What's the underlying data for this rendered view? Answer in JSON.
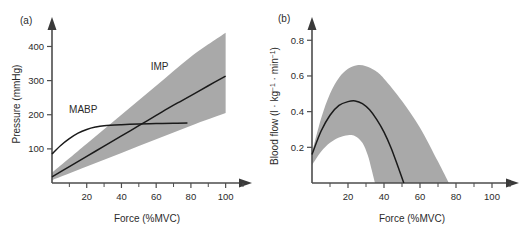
{
  "figure": {
    "background": "#ffffff",
    "band_color": "#a9a9a9",
    "curve_color": "#1a1a1a",
    "axis_color": "#4d4d4d"
  },
  "panel_a": {
    "label": "(a)",
    "chart_data": {
      "type": "line",
      "title": "",
      "xlabel": "Force (%MVC)",
      "ylabel": "Pressure (mmHg)",
      "xlim": [
        0,
        110
      ],
      "ylim": [
        0,
        460
      ],
      "grid": false,
      "legend": "inline-annotations",
      "xticks": [
        20,
        40,
        60,
        80,
        100
      ],
      "xtick_labels": [
        "20",
        "40",
        "60",
        "80",
        "100"
      ],
      "xticks_minor": [
        10,
        30,
        50,
        70,
        90,
        110
      ],
      "yticks": [
        100,
        200,
        300,
        400
      ],
      "ytick_labels": [
        "100",
        "200",
        "300",
        "400"
      ],
      "annotations": [
        {
          "text": "IMP",
          "x": 62,
          "y": 330
        },
        {
          "text": "MABP",
          "x": 18,
          "y": 205
        }
      ],
      "series": [
        {
          "name": "IMP",
          "kind": "line",
          "x": [
            0,
            10,
            20,
            30,
            40,
            50,
            60,
            70,
            80,
            90,
            100
          ],
          "values": [
            18,
            48,
            78,
            108,
            138,
            168,
            198,
            228,
            256,
            285,
            313
          ]
        },
        {
          "name": "MABP",
          "kind": "line",
          "x": [
            0,
            5,
            10,
            15,
            20,
            25,
            30,
            40,
            50,
            60,
            70,
            78
          ],
          "values": [
            85,
            110,
            130,
            146,
            157,
            164,
            168,
            171,
            173,
            174,
            175,
            176
          ]
        },
        {
          "name": "IMP upper bound",
          "kind": "band-upper",
          "x": [
            0,
            20,
            40,
            60,
            80,
            100
          ],
          "values": [
            30,
            115,
            200,
            285,
            370,
            440
          ]
        },
        {
          "name": "IMP lower bound",
          "kind": "band-lower",
          "x": [
            0,
            20,
            40,
            60,
            80,
            100
          ],
          "values": [
            8,
            48,
            88,
            128,
            168,
            205
          ]
        }
      ]
    }
  },
  "panel_b": {
    "label": "(b)",
    "chart_data": {
      "type": "line",
      "title": "",
      "xlabel": "Force (%MVC)",
      "ylabel": "Blood flow (l . kg-1 . min-1)",
      "ylabel_parts": {
        "prefix": "Blood flow (l · kg",
        "sup1": "−1",
        "middle": " · min",
        "sup2": "−1",
        "suffix": ")"
      },
      "xlim": [
        0,
        110
      ],
      "ylim": [
        0,
        0.88
      ],
      "grid": false,
      "legend": "none",
      "xticks": [
        20,
        40,
        60,
        80,
        100
      ],
      "xtick_labels": [
        "20",
        "40",
        "60",
        "80",
        "100"
      ],
      "xticks_minor": [
        10,
        30,
        50,
        70,
        90,
        110
      ],
      "yticks": [
        0.2,
        0.4,
        0.6,
        0.8
      ],
      "ytick_labels": [
        "0.2",
        "0.4",
        "0.6",
        "0.8"
      ],
      "annotations": [],
      "series": [
        {
          "name": "Blood flow mean",
          "kind": "line",
          "x": [
            0,
            5,
            10,
            15,
            20,
            24,
            28,
            32,
            36,
            40,
            44,
            48,
            51
          ],
          "values": [
            0.16,
            0.29,
            0.38,
            0.435,
            0.456,
            0.46,
            0.445,
            0.41,
            0.355,
            0.285,
            0.195,
            0.085,
            0.0
          ]
        },
        {
          "name": "Blood flow upper bound",
          "kind": "band-upper",
          "x": [
            0,
            5,
            10,
            15,
            20,
            25,
            30,
            35,
            40,
            50,
            60,
            70,
            76
          ],
          "values": [
            0.17,
            0.36,
            0.5,
            0.59,
            0.64,
            0.66,
            0.655,
            0.63,
            0.585,
            0.46,
            0.31,
            0.12,
            0.0
          ]
        },
        {
          "name": "Blood flow lower bound",
          "kind": "band-lower",
          "x": [
            0,
            5,
            10,
            15,
            20,
            24,
            28,
            31,
            33,
            35
          ],
          "values": [
            0.1,
            0.175,
            0.225,
            0.255,
            0.268,
            0.262,
            0.225,
            0.155,
            0.08,
            0.0
          ]
        }
      ]
    }
  }
}
